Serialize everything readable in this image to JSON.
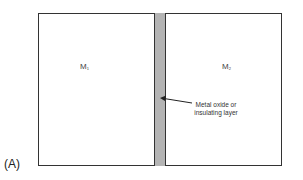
{
  "diagram": {
    "panel_label": "(A)",
    "regions": [
      {
        "name": "M",
        "subscript": "1"
      },
      {
        "name": "M",
        "subscript": "2"
      }
    ],
    "annotation": {
      "line1": "Metal oxide or",
      "line2": "insulating layer"
    },
    "colors": {
      "outline": "#333333",
      "layer_fill": "#b4b4b4",
      "background": "#ffffff"
    }
  }
}
